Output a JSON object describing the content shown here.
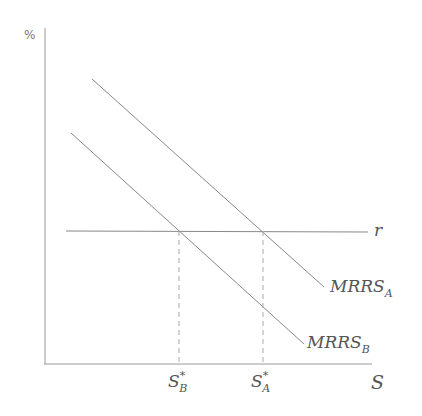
{
  "diagram": {
    "y_axis_label": "%",
    "x_axis_label": "S",
    "horizontal_line_label": "r",
    "curves": [
      {
        "name": "MRRS",
        "subscript": "A"
      },
      {
        "name": "MRRS",
        "subscript": "B"
      }
    ],
    "x_ticks": [
      {
        "base": "S",
        "sup": "*",
        "sub": "B"
      },
      {
        "base": "S",
        "sup": "*",
        "sub": "A"
      }
    ],
    "colors": {
      "line": "#888888",
      "axis": "#999999",
      "text": "#555555"
    }
  }
}
